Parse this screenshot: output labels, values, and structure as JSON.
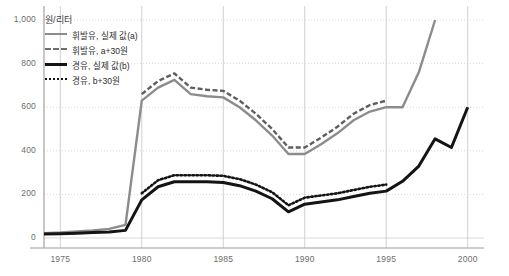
{
  "chart_data": {
    "type": "line",
    "title": "",
    "subtitle": "",
    "unit_label": "원/리터",
    "xlabel": "",
    "ylabel": "",
    "xlim": [
      1974,
      2001
    ],
    "ylim": [
      0,
      1000
    ],
    "grid": true,
    "legend_position": "top-left",
    "x_ticks": [
      "1975",
      "1980",
      "1985",
      "1990",
      "1995",
      "2000"
    ],
    "x_tick_values": [
      1975,
      1980,
      1985,
      1990,
      1995,
      2000
    ],
    "y_ticks": [
      "0",
      "200",
      "400",
      "600",
      "800",
      "1,000"
    ],
    "y_tick_values": [
      0,
      200,
      400,
      600,
      800,
      1000
    ],
    "series": [
      {
        "name": "휘발유, 실제 값(a)",
        "key": "gasoline_actual",
        "color": "#8c8c8c",
        "style": "solid",
        "x": [
          1974,
          1975,
          1976,
          1977,
          1978,
          1979,
          1980,
          1981,
          1982,
          1983,
          1984,
          1985,
          1986,
          1987,
          1988,
          1989,
          1990,
          1991,
          1992,
          1993,
          1994,
          1995,
          1996,
          1997,
          1998
        ],
        "values": [
          22,
          25,
          30,
          35,
          42,
          60,
          630,
          690,
          725,
          660,
          650,
          645,
          600,
          540,
          470,
          385,
          385,
          430,
          480,
          540,
          580,
          600,
          600,
          760,
          1000
        ]
      },
      {
        "name": "휘발유, a+30원",
        "key": "gasoline_plus30",
        "color": "#5e5e5e",
        "style": "dashed",
        "x": [
          1980,
          1981,
          1982,
          1983,
          1984,
          1985,
          1986,
          1987,
          1988,
          1989,
          1990,
          1991,
          1992,
          1993,
          1994,
          1995
        ],
        "values": [
          660,
          720,
          755,
          690,
          680,
          675,
          630,
          570,
          500,
          415,
          415,
          460,
          510,
          570,
          610,
          630
        ]
      },
      {
        "name": "경유, 실제 값(b)",
        "key": "diesel_actual",
        "color": "#141414",
        "style": "solid",
        "x": [
          1974,
          1975,
          1976,
          1977,
          1978,
          1979,
          1980,
          1981,
          1982,
          1983,
          1984,
          1985,
          1986,
          1987,
          1988,
          1989,
          1990,
          1991,
          1992,
          1993,
          1994,
          1995,
          1996,
          1997,
          1998,
          1999,
          2000
        ],
        "values": [
          18,
          20,
          22,
          25,
          28,
          35,
          175,
          235,
          258,
          258,
          258,
          255,
          240,
          215,
          180,
          120,
          155,
          165,
          175,
          190,
          205,
          215,
          260,
          330,
          455,
          415,
          600
        ]
      },
      {
        "name": "경유, b+30원",
        "key": "diesel_plus30",
        "color": "#141414",
        "style": "dotted",
        "x": [
          1980,
          1981,
          1982,
          1983,
          1984,
          1985,
          1986,
          1987,
          1988,
          1989,
          1990,
          1991,
          1992,
          1993,
          1994,
          1995
        ],
        "values": [
          205,
          265,
          288,
          288,
          288,
          285,
          270,
          245,
          210,
          150,
          185,
          195,
          205,
          220,
          235,
          245
        ]
      }
    ]
  },
  "axis": {
    "y_labels": [
      "1,000",
      "800",
      "600",
      "400",
      "200",
      "0"
    ],
    "x_labels": [
      "1975",
      "1980",
      "1985",
      "1990",
      "1995",
      "2000"
    ]
  },
  "legend": {
    "items": [
      {
        "label": "휘발유, 실제 값(a)",
        "swatch": "solid-gray"
      },
      {
        "label": "휘발유, a+30원",
        "swatch": "dash-gray"
      },
      {
        "label": "경유, 실제 값(b)",
        "swatch": "solid-black"
      },
      {
        "label": "경유, b+30원",
        "swatch": "dot-black"
      }
    ]
  },
  "unit": {
    "label": "원/리터"
  }
}
